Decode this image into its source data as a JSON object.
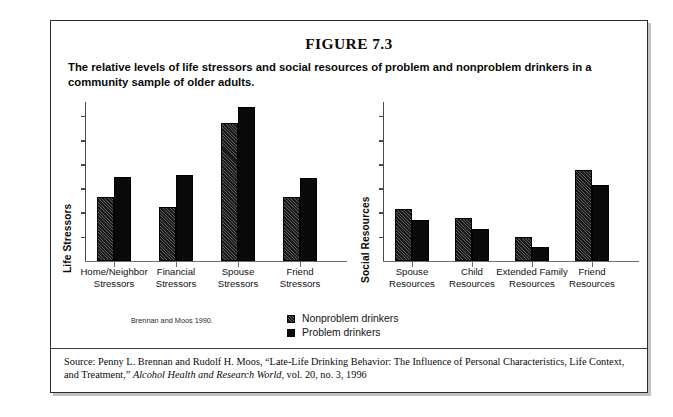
{
  "figure": {
    "title": "FIGURE 7.3",
    "caption": "The relative levels of life stressors and social resources of problem and nonproblem drinkers in a community sample of older adults.",
    "chart_citation": "Brennan and Moos 1990.",
    "source_prefix": "Source: Penny L. Brennan and Rudolf H. Moos, “Late-Life Drinking Behavior: The Influence of Personal Characteristics, Life Context, and Treatment,” ",
    "source_journal": "Alcohol Health and Research World",
    "source_suffix": ", vol. 20, no. 3, 1996"
  },
  "legend": {
    "entries": [
      {
        "label": "Nonproblem drinkers",
        "color": "#1a1a1a",
        "pattern": "diagonal-hatch"
      },
      {
        "label": "Problem drinkers",
        "color": "#0a0a0a",
        "pattern": "solid"
      }
    ]
  },
  "chart_data": [
    {
      "type": "bar",
      "title": "",
      "ylabel": "Life Stressors",
      "xlabel": "",
      "categories": [
        "Home/Neighbor\nStressors",
        "Financial\nStressors",
        "Spouse\nStressors",
        "Friend\nStressors"
      ],
      "category_lines": [
        [
          "Home/Neighbor",
          "Stressors"
        ],
        [
          "Financial",
          "Stressors"
        ],
        [
          "Spouse",
          "Stressors"
        ],
        [
          "Friend",
          "Stressors"
        ]
      ],
      "series": [
        {
          "name": "Nonproblem drinkers",
          "values": [
            0.4,
            0.34,
            0.87,
            0.4
          ]
        },
        {
          "name": "Problem drinkers",
          "values": [
            0.53,
            0.54,
            0.97,
            0.52
          ]
        }
      ],
      "ylim": [
        0,
        1.0
      ],
      "y_tick_count": 6,
      "y_tick_labels": [],
      "grid": false,
      "legend_position": "below-center"
    },
    {
      "type": "bar",
      "title": "",
      "ylabel": "Social Resources",
      "xlabel": "",
      "categories": [
        "Spouse\nResources",
        "Child\nResources",
        "Extended Family\nResources",
        "Friend\nResources"
      ],
      "category_lines": [
        [
          "Spouse",
          "Resources"
        ],
        [
          "Child",
          "Resources"
        ],
        [
          "Extended Family",
          "Resources"
        ],
        [
          "Friend",
          "Resources"
        ]
      ],
      "series": [
        {
          "name": "Nonproblem drinkers",
          "values": [
            0.33,
            0.27,
            0.15,
            0.57
          ]
        },
        {
          "name": "Problem drinkers",
          "values": [
            0.26,
            0.2,
            0.09,
            0.48
          ]
        }
      ],
      "ylim": [
        0,
        1.0
      ],
      "y_tick_count": 6,
      "y_tick_labels": [],
      "grid": false,
      "legend_position": "below-center"
    }
  ]
}
